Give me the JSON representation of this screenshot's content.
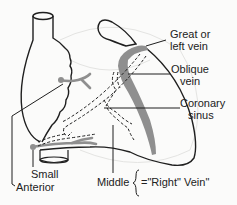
{
  "labels": {
    "great_vein": [
      "Great or",
      "left vein"
    ],
    "oblique_vein": [
      "Oblique",
      "vein"
    ],
    "coronary_sinus": [
      "Coronary",
      "sinus"
    ],
    "small": "Small",
    "anterior": "Anterior",
    "middle": "Middle",
    "right_vein": "=\"Right\" Vein\""
  },
  "colors": {
    "outline": "#1f1f1f",
    "vein_fill": "#8f8f8f",
    "background": "#fbfbfa"
  }
}
